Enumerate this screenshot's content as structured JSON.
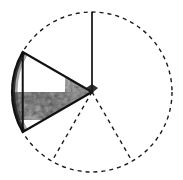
{
  "figure": {
    "background_color": "#ffffff",
    "stroke_color": "#1a1a1a",
    "canvas": {
      "width": 183,
      "height": 180
    },
    "circle": {
      "center_x": 92,
      "center_y": 92,
      "radius": 80,
      "outline_style": "dashed",
      "dash_length": 4,
      "dash_gap": 4,
      "stroke_width": 1.4
    },
    "highlighted_sector": {
      "label": "textured sector",
      "start_angle_deg": 240,
      "end_angle_deg": 300,
      "sweep_deg": 120,
      "fill": "grayscale-mottled-texture",
      "edge_color": "#111111",
      "edge_width": 2.2,
      "texture_mean_gray": "#8a8a8a",
      "texture_dark_gray": "#2b2b2b",
      "texture_light_gray": "#d8d8d8"
    },
    "divider_line": {
      "label": "vertical bisector",
      "from_x": 92,
      "from_y": 92,
      "to_x": 92,
      "to_y": 12,
      "style": "solid",
      "color": "#000000",
      "stroke_width": 1.6
    },
    "dashed_radii": [
      {
        "label": "radius lower-left",
        "angle_deg": 240,
        "from_x": 92,
        "from_y": 92,
        "to_x": 52,
        "to_y": 161
      },
      {
        "label": "radius lower-right",
        "angle_deg": 300,
        "from_x": 92,
        "from_y": 92,
        "to_x": 132,
        "to_y": 161
      }
    ],
    "chord": {
      "label": "sector base chord",
      "from_x": 22,
      "from_y": 72,
      "to_x": 162,
      "to_y": 72,
      "style": "solid",
      "color": "#111111"
    }
  }
}
